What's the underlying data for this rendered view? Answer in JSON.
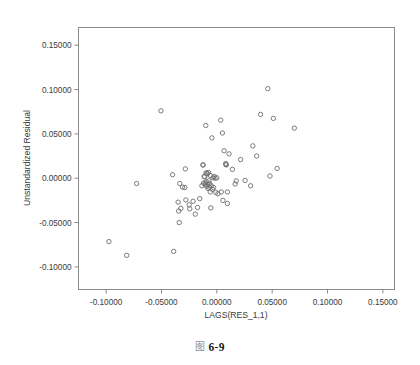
{
  "caption": {
    "glyph": "图",
    "text": "6-9"
  },
  "chart_data": {
    "type": "scatter",
    "title": "",
    "xlabel": "LAGS(RES_1,1)",
    "ylabel": "Unstandardized Residual",
    "xlim": [
      -0.125,
      0.1605
    ],
    "ylim": [
      -0.1255,
      0.17
    ],
    "xticks": [
      -0.1,
      -0.05,
      0.0,
      0.05,
      0.1,
      0.15
    ],
    "yticks": [
      0.15,
      0.1,
      0.05,
      0.0,
      -0.05,
      -0.1
    ],
    "xticklabels": [
      "-0.10000",
      "-0.05000",
      "0.00000",
      "0.05000",
      "0.10000",
      "0.15000"
    ],
    "yticklabels": [
      "0.15000",
      "0.10000",
      "0.05000",
      "0.00000",
      "-0.05000",
      "-0.10000"
    ],
    "grid": false,
    "legend": null,
    "marker": {
      "shape": "open-circle",
      "radius_px": 2.2,
      "stroke": "#6e6e6e",
      "fill": "none"
    },
    "n_points": 79,
    "points": [
      [
        -0.0975,
        -0.0715
      ],
      [
        -0.0815,
        -0.087
      ],
      [
        -0.0725,
        -0.006
      ],
      [
        -0.0505,
        0.076
      ],
      [
        -0.04,
        0.004
      ],
      [
        -0.039,
        -0.0825
      ],
      [
        -0.035,
        -0.027
      ],
      [
        -0.0345,
        -0.037
      ],
      [
        -0.034,
        -0.05
      ],
      [
        -0.0335,
        -0.006
      ],
      [
        -0.0325,
        -0.034
      ],
      [
        -0.031,
        -0.01
      ],
      [
        -0.029,
        -0.0105
      ],
      [
        -0.0285,
        0.0105
      ],
      [
        -0.028,
        -0.0245
      ],
      [
        -0.025,
        -0.03
      ],
      [
        -0.0245,
        -0.0345
      ],
      [
        -0.0215,
        -0.026
      ],
      [
        -0.0195,
        -0.0405
      ],
      [
        -0.0175,
        -0.033
      ],
      [
        -0.0155,
        -0.023
      ],
      [
        -0.0135,
        -0.0085
      ],
      [
        -0.0125,
        0.015
      ],
      [
        -0.012,
        -0.0055
      ],
      [
        -0.0115,
        0.002
      ],
      [
        -0.011,
        0.0015
      ],
      [
        -0.0105,
        -0.0075
      ],
      [
        -0.01,
        0.0595
      ],
      [
        -0.0098,
        0.006
      ],
      [
        -0.0095,
        -0.004
      ],
      [
        -0.009,
        -0.009
      ],
      [
        -0.0085,
        0.005
      ],
      [
        -0.0082,
        -0.007
      ],
      [
        -0.008,
        -0.0115
      ],
      [
        -0.0075,
        0.0065
      ],
      [
        -0.0072,
        -0.003
      ],
      [
        -0.007,
        -0.01
      ],
      [
        -0.0065,
        -0.006
      ],
      [
        -0.006,
        -0.0155
      ],
      [
        -0.0058,
        0.003
      ],
      [
        -0.0055,
        -0.0335
      ],
      [
        -0.005,
        -0.0085
      ],
      [
        -0.0045,
        0.0455
      ],
      [
        -0.004,
        -0.0125
      ],
      [
        -0.0035,
        0.0005
      ],
      [
        -0.003,
        -0.0105
      ],
      [
        -0.0025,
        0.002
      ],
      [
        -0.0015,
        0.0
      ],
      [
        -0.001,
        -0.016
      ],
      [
        0.0,
        0.0005
      ],
      [
        0.001,
        -0.0175
      ],
      [
        0.0035,
        0.0655
      ],
      [
        0.004,
        -0.0155
      ],
      [
        0.005,
        0.051
      ],
      [
        0.0055,
        -0.025
      ],
      [
        0.0065,
        0.031
      ],
      [
        0.008,
        0.0165
      ],
      [
        0.0082,
        0.0155
      ],
      [
        0.0085,
        0.015
      ],
      [
        0.0095,
        -0.0285
      ],
      [
        0.011,
        0.0275
      ],
      [
        0.014,
        0.01
      ],
      [
        0.0165,
        -0.0065
      ],
      [
        0.0175,
        -0.003
      ],
      [
        0.0215,
        0.021
      ],
      [
        0.0255,
        -0.0025
      ],
      [
        0.0305,
        -0.0085
      ],
      [
        0.0325,
        0.0365
      ],
      [
        0.036,
        0.025
      ],
      [
        0.0395,
        0.072
      ],
      [
        0.046,
        0.101
      ],
      [
        0.048,
        0.0025
      ],
      [
        0.051,
        0.0675
      ],
      [
        0.0545,
        0.011
      ],
      [
        0.07,
        0.0565
      ],
      [
        0.0095,
        -0.0155
      ],
      [
        -0.0125,
        0.015
      ],
      [
        -0.009,
        0.0055
      ],
      [
        -0.0105,
        -0.0055
      ]
    ]
  }
}
